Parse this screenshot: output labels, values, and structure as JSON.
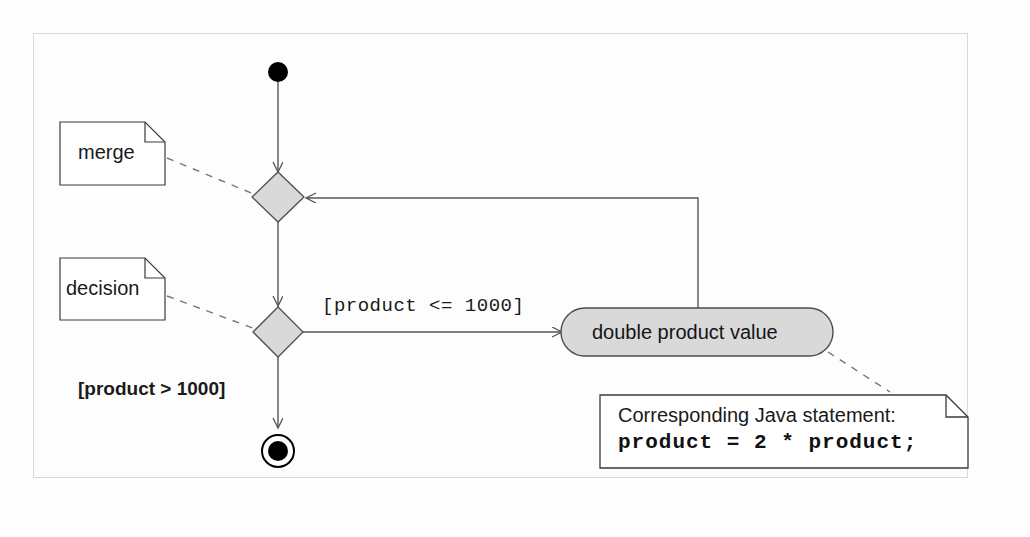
{
  "diagram": {
    "type": "uml-activity-diagram",
    "title": "",
    "colors": {
      "node_fill": "#d9d9d9",
      "node_stroke": "#4d4d4d",
      "line": "#555555",
      "note_fill": "#ffffff",
      "note_stroke": "#3a3a3a",
      "frame_stroke": "#d8d8d8",
      "solid_black": "#000000"
    },
    "nodes": {
      "initial": {
        "name": "initial-node",
        "label": ""
      },
      "merge": {
        "name": "merge-node",
        "label": ""
      },
      "decision": {
        "name": "decision-node",
        "label": ""
      },
      "action": {
        "name": "action-node",
        "label": "double product value"
      },
      "final": {
        "name": "final-node",
        "label": ""
      }
    },
    "guards": {
      "true_branch": "[product <= 1000]",
      "false_branch": "[product > 1000]"
    },
    "notes": [
      {
        "id": "merge-note",
        "text": "merge"
      },
      {
        "id": "decision-note",
        "text": "decision"
      }
    ],
    "code_note": {
      "caption": "Corresponding Java statement:",
      "code": "product = 2 * product;"
    }
  }
}
